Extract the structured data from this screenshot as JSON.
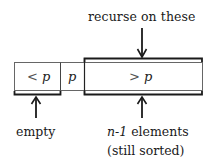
{
  "diagram": {
    "top_annotation": "recurse on these",
    "cells": [
      {
        "op": "<",
        "var": "p"
      },
      {
        "op": "",
        "var": "p"
      },
      {
        "op": ">",
        "var": "p"
      }
    ],
    "bottom_left_annotation": "empty",
    "bottom_right_annotation": {
      "math": "n-1",
      "text": " elements",
      "line2": "(still sorted)"
    },
    "colors": {
      "stroke": "#1a1a1a",
      "cell_border": "#555555",
      "background": "#ffffff"
    }
  }
}
